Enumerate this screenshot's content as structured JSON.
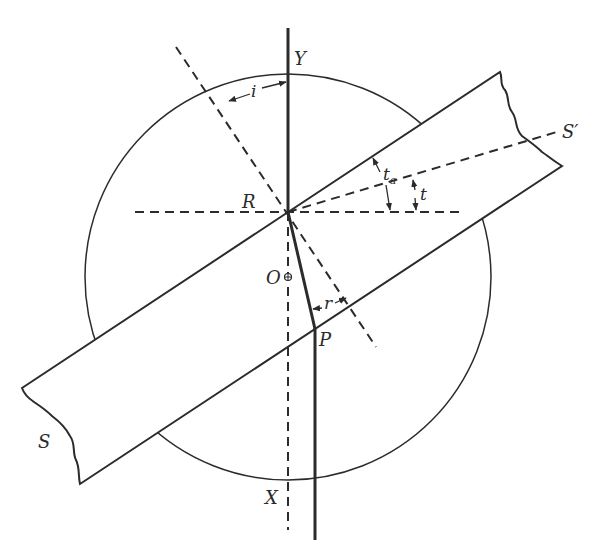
{
  "diagram": {
    "colors": {
      "ink": "#2b2b2b",
      "background": "#ffffff"
    },
    "labels": {
      "Y": "Y",
      "X": "X",
      "R": "R",
      "O": "O",
      "P": "P",
      "S": "S",
      "S_prime": "S′",
      "i": "i",
      "r": "r",
      "t": "t",
      "t_a_main": "t",
      "t_a_sub": "a"
    },
    "elements": {
      "circle": {
        "center": [
          288,
          277
        ],
        "radius": 203
      },
      "slab": {
        "corners": {
          "top_left": [
            22,
            388
          ],
          "bottom_left": [
            80,
            484
          ],
          "top_right": [
            500,
            72
          ],
          "bottom_right": [
            562,
            166
          ]
        },
        "edges": [
          "wavy break at S end",
          "wavy break at S' end"
        ]
      },
      "incident_ray_Y_to_R": {
        "from": [
          288,
          28
        ],
        "to": [
          288,
          212
        ]
      },
      "refracted_ray_R_to_P": {
        "from": [
          288,
          212
        ],
        "to": [
          315,
          328
        ]
      },
      "emergent_ray_P_down": {
        "from": [
          315,
          328
        ],
        "to": [
          315,
          540
        ]
      },
      "normal_dashed": {
        "from": [
          176,
          47
        ],
        "to": [
          376,
          347
        ]
      },
      "vertical_dashed_R_to_X": {
        "from": [
          288,
          212
        ],
        "to": [
          288,
          530
        ]
      },
      "horizontal_dashed": {
        "from": [
          135,
          212
        ],
        "to": [
          462,
          212
        ]
      },
      "S_prime_dashed": {
        "from": [
          288,
          212
        ],
        "to": [
          560,
          131
        ]
      }
    }
  }
}
